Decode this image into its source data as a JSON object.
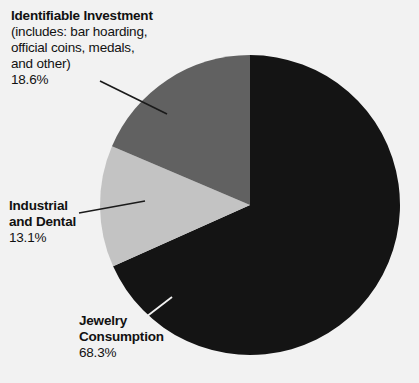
{
  "chart_data": {
    "type": "pie",
    "title": "",
    "subtitle": "",
    "xlabel": "",
    "ylabel": "",
    "legend_position": "callout-labels",
    "grid": false,
    "categories": [
      "Jewelry Consumption",
      "Identifiable Investment",
      "Industrial and Dental"
    ],
    "values": [
      68.3,
      18.6,
      13.1
    ],
    "units": "%",
    "start_angle_deg": 0,
    "direction": "counterclockwise",
    "slices": [
      {
        "label": "Identifiable Investment",
        "detail": "(includes: bar hoarding, official coins, medals, and other)",
        "value": 18.6,
        "value_text": "18.6%",
        "color": "#616161"
      },
      {
        "label": "Industrial and Dental",
        "detail": "",
        "value": 13.1,
        "value_text": "13.1%",
        "color": "#c3c3c3"
      },
      {
        "label": "Jewelry Consumption",
        "detail": "",
        "value": 68.3,
        "value_text": "68.3%",
        "color": "#141414"
      }
    ]
  },
  "background_color": "#f2f2f2",
  "labels": {
    "investment": {
      "line1": "Identifiable Investment",
      "line2": "(includes: bar hoarding,",
      "line3": "official coins, medals,",
      "line4": "and other)",
      "percent": "18.6%"
    },
    "industrial": {
      "line1": "Industrial",
      "line2": "and Dental",
      "percent": "13.1%"
    },
    "jewelry": {
      "line1": "Jewelry",
      "line2": "Consumption",
      "percent": "68.3%"
    }
  }
}
